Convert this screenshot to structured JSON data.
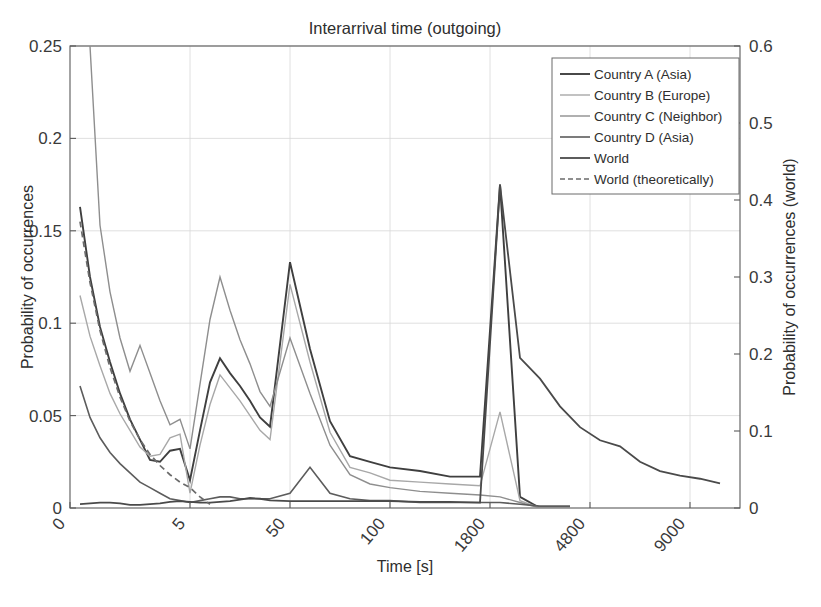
{
  "chart_data": {
    "type": "line",
    "title": "Interarrival time (outgoing)",
    "xlabel": "Time [s]",
    "ylabel": "Probability of occurrences",
    "ylabel_right": "Probability of occurrences (world)",
    "grid": true,
    "legend_position": "top-right",
    "xtick_labels": [
      "0",
      "5",
      "50",
      "100",
      "1800",
      "4800",
      "9000"
    ],
    "xtick_positions": [
      0,
      12,
      22,
      32,
      42,
      52,
      62
    ],
    "xlim": [
      0,
      67
    ],
    "ytick_labels": [
      "0",
      "0.05",
      "0.1",
      "0.15",
      "0.2",
      "0.25"
    ],
    "ytick_values": [
      0,
      0.05,
      0.1,
      0.15,
      0.2,
      0.25
    ],
    "ylim": [
      0,
      0.25
    ],
    "ytick_labels_right": [
      "0",
      "0.1",
      "0.2",
      "0.3",
      "0.4",
      "0.5",
      "0.6"
    ],
    "ytick_values_right": [
      0,
      0.1,
      0.2,
      0.3,
      0.4,
      0.5,
      0.6
    ],
    "ylim_right": [
      0,
      0.6
    ],
    "series": [
      {
        "name": "Country A (Asia)",
        "color": "#3f3f3f",
        "width": 1.9,
        "dash": "none",
        "axis": "left",
        "x": [
          1,
          2,
          3,
          4,
          5,
          6,
          7,
          8,
          9,
          10,
          11,
          12,
          13,
          14,
          15,
          16,
          17,
          18,
          19,
          20,
          22,
          24,
          26,
          28,
          30,
          32,
          35,
          38,
          41,
          43,
          45,
          47,
          50
        ],
        "values": [
          0.163,
          0.125,
          0.098,
          0.079,
          0.062,
          0.048,
          0.037,
          0.026,
          0.025,
          0.031,
          0.032,
          0.015,
          0.042,
          0.068,
          0.081,
          0.073,
          0.066,
          0.058,
          0.049,
          0.044,
          0.133,
          0.086,
          0.047,
          0.028,
          0.025,
          0.022,
          0.02,
          0.017,
          0.017,
          0.175,
          0.006,
          0.0,
          0.0
        ]
      },
      {
        "name": "Country B (Europe)",
        "color": "#a8a8a8",
        "width": 1.4,
        "dash": "none",
        "axis": "left",
        "x": [
          1,
          2,
          3,
          4,
          5,
          6,
          7,
          8,
          9,
          10,
          11,
          12,
          13,
          14,
          15,
          16,
          17,
          18,
          19,
          20,
          22,
          24,
          26,
          28,
          30,
          32,
          35,
          38,
          41,
          43,
          45,
          47,
          50
        ],
        "values": [
          0.115,
          0.093,
          0.077,
          0.062,
          0.051,
          0.042,
          0.033,
          0.028,
          0.029,
          0.038,
          0.04,
          0.008,
          0.034,
          0.056,
          0.072,
          0.065,
          0.058,
          0.05,
          0.042,
          0.037,
          0.121,
          0.079,
          0.041,
          0.022,
          0.019,
          0.015,
          0.014,
          0.013,
          0.012,
          0.052,
          0.004,
          0.0,
          0.0
        ]
      },
      {
        "name": "Country C (Neighbor)",
        "color": "#8e8e8e",
        "width": 1.4,
        "dash": "none",
        "axis": "left",
        "x": [
          1,
          2,
          3,
          4,
          5,
          6,
          7,
          8,
          9,
          10,
          11,
          12,
          13,
          14,
          15,
          16,
          17,
          18,
          19,
          20,
          22,
          24,
          26,
          28,
          30,
          32,
          35,
          38,
          41,
          43,
          45,
          47,
          50
        ],
        "values": [
          0.38,
          0.25,
          0.153,
          0.117,
          0.092,
          0.074,
          0.088,
          0.073,
          0.058,
          0.045,
          0.048,
          0.032,
          0.067,
          0.102,
          0.125,
          0.107,
          0.091,
          0.078,
          0.063,
          0.055,
          0.092,
          0.062,
          0.034,
          0.018,
          0.013,
          0.011,
          0.009,
          0.008,
          0.007,
          0.006,
          0.003,
          0.0,
          0.0
        ]
      },
      {
        "name": "Country D (Asia)",
        "color": "#5c5c5c",
        "width": 1.6,
        "dash": "none",
        "axis": "left",
        "x": [
          1,
          2,
          3,
          4,
          5,
          6,
          7,
          8,
          9,
          10,
          11,
          12,
          13,
          14,
          15,
          16,
          17,
          18,
          19,
          20,
          22,
          24,
          26,
          28,
          30,
          32,
          35,
          38,
          41,
          43,
          45,
          47,
          50
        ],
        "values": [
          0.066,
          0.049,
          0.038,
          0.03,
          0.024,
          0.019,
          0.014,
          0.011,
          0.008,
          0.005,
          0.004,
          0.003,
          0.004,
          0.005,
          0.006,
          0.006,
          0.005,
          0.005,
          0.005,
          0.005,
          0.008,
          0.022,
          0.008,
          0.005,
          0.004,
          0.004,
          0.003,
          0.003,
          0.003,
          0.003,
          0.002,
          0.001,
          0.001
        ]
      },
      {
        "name": "World",
        "color": "#4a4a4a",
        "width": 1.8,
        "dash": "none",
        "axis": "right",
        "x": [
          1,
          2,
          3,
          4,
          5,
          6,
          7,
          8,
          9,
          10,
          11,
          12,
          13,
          14,
          15,
          16,
          17,
          18,
          19,
          20,
          22,
          24,
          26,
          28,
          30,
          32,
          35,
          38,
          41,
          43,
          45,
          47,
          49,
          51,
          53,
          55,
          57,
          59,
          61,
          63,
          65
        ],
        "values": [
          0.005,
          0.006,
          0.007,
          0.007,
          0.006,
          0.004,
          0.004,
          0.005,
          0.006,
          0.008,
          0.009,
          0.008,
          0.007,
          0.007,
          0.008,
          0.009,
          0.011,
          0.013,
          0.012,
          0.01,
          0.009,
          0.009,
          0.009,
          0.009,
          0.009,
          0.009,
          0.008,
          0.008,
          0.007,
          0.42,
          0.195,
          0.168,
          0.132,
          0.105,
          0.088,
          0.08,
          0.06,
          0.048,
          0.042,
          0.038,
          0.032
        ]
      },
      {
        "name": "World (theoretically)",
        "color": "#6b6b6b",
        "width": 1.7,
        "dash": "6,4",
        "axis": "left",
        "x": [
          1,
          2,
          3,
          4,
          5,
          6,
          7,
          8,
          9,
          10,
          11,
          12,
          13,
          14
        ],
        "values": [
          0.155,
          0.122,
          0.096,
          0.076,
          0.06,
          0.047,
          0.037,
          0.029,
          0.023,
          0.018,
          0.014,
          0.011,
          0.006,
          0.002
        ]
      }
    ]
  }
}
